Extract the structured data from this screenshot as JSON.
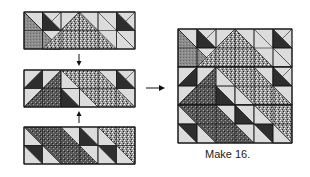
{
  "caption": "Make 16.",
  "colors": {
    "light": "#dcdcdc",
    "dark": "#2e2e2e",
    "medium": "#8a8a8a",
    "outline": "#1a1a1a",
    "arrow": "#111111"
  },
  "layout": {
    "strip_x": 24,
    "strip_cell": 18.5,
    "strips_y": [
      12,
      70,
      127
    ],
    "block_x": 178,
    "block_y": 29,
    "block_cell": 19
  },
  "strips": [
    {
      "name": "top-strip",
      "shapes": [
        {
          "type": "tri",
          "pts": [
            [
              0,
              0
            ],
            [
              1,
              0
            ],
            [
              1,
              1
            ]
          ],
          "fill": "light"
        },
        {
          "type": "tri",
          "pts": [
            [
              0,
              0
            ],
            [
              0,
              2
            ],
            [
              2,
              2
            ]
          ],
          "fill": "medium"
        },
        {
          "type": "tri",
          "pts": [
            [
              0,
              0
            ],
            [
              1,
              1
            ],
            [
              1,
              2
            ],
            [
              2,
              2
            ]
          ],
          "fill": "medium"
        },
        {
          "type": "tri",
          "pts": [
            [
              1,
              0
            ],
            [
              2,
              0
            ],
            [
              1,
              1
            ]
          ],
          "fill": "light"
        },
        {
          "type": "tri",
          "pts": [
            [
              1,
              0
            ],
            [
              2,
              1
            ],
            [
              1,
              1
            ]
          ],
          "fill": "dark"
        },
        {
          "type": "tri",
          "pts": [
            [
              2,
              0
            ],
            [
              3,
              0
            ],
            [
              2,
              1
            ]
          ],
          "fill": "light"
        },
        {
          "type": "tri",
          "pts": [
            [
              3,
              0
            ],
            [
              3,
              1
            ],
            [
              2,
              1
            ]
          ],
          "fill": "dark"
        },
        {
          "type": "tri",
          "pts": [
            [
              1,
              1
            ],
            [
              2,
              1
            ],
            [
              2,
              2
            ]
          ],
          "fill": "light"
        },
        {
          "type": "tri",
          "pts": [
            [
              2,
              1
            ],
            [
              3,
              1
            ],
            [
              2,
              2
            ]
          ],
          "fill": "light"
        },
        {
          "type": "tri",
          "pts": [
            [
              3,
              0
            ],
            [
              5,
              2
            ],
            [
              1,
              2
            ]
          ],
          "fill": "speckle"
        },
        {
          "type": "tri",
          "pts": [
            [
              3,
              0
            ],
            [
              4,
              0
            ],
            [
              4,
              1
            ]
          ],
          "fill": "light"
        },
        {
          "type": "tri",
          "pts": [
            [
              4,
              0
            ],
            [
              5,
              0
            ],
            [
              5,
              1
            ]
          ],
          "fill": "light"
        },
        {
          "type": "tri",
          "pts": [
            [
              5,
              0
            ],
            [
              6,
              0
            ],
            [
              5,
              1
            ]
          ],
          "fill": "light"
        },
        {
          "type": "tri",
          "pts": [
            [
              5,
              0
            ],
            [
              6,
              1
            ],
            [
              5,
              1
            ]
          ],
          "fill": "dark"
        },
        {
          "type": "tri",
          "pts": [
            [
              5,
              1
            ],
            [
              6,
              1
            ],
            [
              6,
              2
            ]
          ],
          "fill": "light"
        },
        {
          "type": "tri",
          "pts": [
            [
              5,
              1
            ],
            [
              6,
              2
            ],
            [
              5,
              2
            ]
          ],
          "fill": "light"
        }
      ]
    },
    {
      "name": "middle-strip",
      "shapes": [
        {
          "type": "tri",
          "pts": [
            [
              0,
              0
            ],
            [
              1,
              0
            ],
            [
              0,
              1
            ]
          ],
          "fill": "light"
        },
        {
          "type": "tri",
          "pts": [
            [
              1,
              0
            ],
            [
              1,
              1
            ],
            [
              0,
              1
            ]
          ],
          "fill": "dark"
        },
        {
          "type": "tri",
          "pts": [
            [
              0,
              1
            ],
            [
              1,
              1
            ],
            [
              0,
              2
            ]
          ],
          "fill": "light"
        },
        {
          "type": "tri",
          "pts": [
            [
              2,
              0
            ],
            [
              0,
              2
            ],
            [
              2,
              2
            ]
          ],
          "fill": "darkspeckle"
        },
        {
          "type": "tri",
          "pts": [
            [
              1,
              0
            ],
            [
              2,
              0
            ],
            [
              1,
              1
            ]
          ],
          "fill": "light"
        },
        {
          "type": "tri",
          "pts": [
            [
              2,
              0
            ],
            [
              4,
              0
            ],
            [
              6,
              2
            ],
            [
              4,
              2
            ]
          ],
          "fill": "speckle"
        },
        {
          "type": "tri",
          "pts": [
            [
              2,
              1
            ],
            [
              3,
              1
            ],
            [
              3,
              2
            ]
          ],
          "fill": "light"
        },
        {
          "type": "tri",
          "pts": [
            [
              2,
              1
            ],
            [
              3,
              2
            ],
            [
              2,
              2
            ]
          ],
          "fill": "dark"
        },
        {
          "type": "tri",
          "pts": [
            [
              3,
              1
            ],
            [
              4,
              2
            ],
            [
              3,
              2
            ]
          ],
          "fill": "light"
        },
        {
          "type": "tri",
          "pts": [
            [
              4,
              0
            ],
            [
              5,
              0
            ],
            [
              5,
              1
            ]
          ],
          "fill": "light"
        },
        {
          "type": "tri",
          "pts": [
            [
              5,
              0
            ],
            [
              6,
              0
            ],
            [
              5,
              1
            ]
          ],
          "fill": "light"
        },
        {
          "type": "tri",
          "pts": [
            [
              5,
              0
            ],
            [
              6,
              1
            ],
            [
              5,
              1
            ]
          ],
          "fill": "dark"
        },
        {
          "type": "tri",
          "pts": [
            [
              5,
              1
            ],
            [
              6,
              1
            ],
            [
              6,
              2
            ]
          ],
          "fill": "light"
        }
      ]
    },
    {
      "name": "bottom-strip",
      "shapes": [
        {
          "type": "tri",
          "pts": [
            [
              0,
              0
            ],
            [
              2,
              0
            ],
            [
              4,
              2
            ],
            [
              2,
              2
            ]
          ],
          "fill": "darkspeckle"
        },
        {
          "type": "tri",
          "pts": [
            [
              0,
              0
            ],
            [
              1,
              1
            ],
            [
              0,
              1
            ]
          ],
          "fill": "light"
        },
        {
          "type": "tri",
          "pts": [
            [
              0,
              1
            ],
            [
              1,
              1
            ],
            [
              1,
              2
            ]
          ],
          "fill": "dark"
        },
        {
          "type": "tri",
          "pts": [
            [
              0,
              1
            ],
            [
              1,
              2
            ],
            [
              0,
              2
            ]
          ],
          "fill": "light"
        },
        {
          "type": "tri",
          "pts": [
            [
              1,
              1
            ],
            [
              2,
              2
            ],
            [
              1,
              2
            ]
          ],
          "fill": "light"
        },
        {
          "type": "tri",
          "pts": [
            [
              2,
              0
            ],
            [
              3,
              0
            ],
            [
              3,
              1
            ]
          ],
          "fill": "light"
        },
        {
          "type": "tri",
          "pts": [
            [
              3,
              0
            ],
            [
              4,
              0
            ],
            [
              4,
              1
            ]
          ],
          "fill": "light"
        },
        {
          "type": "tri",
          "pts": [
            [
              3,
              0
            ],
            [
              4,
              1
            ],
            [
              3,
              1
            ]
          ],
          "fill": "dark"
        },
        {
          "type": "tri",
          "pts": [
            [
              3,
              1
            ],
            [
              4,
              1
            ],
            [
              4,
              2
            ]
          ],
          "fill": "light"
        },
        {
          "type": "tri",
          "pts": [
            [
              4,
              0
            ],
            [
              6,
              0
            ],
            [
              6,
              2
            ]
          ],
          "fill": "speckle"
        },
        {
          "type": "tri",
          "pts": [
            [
              4,
              0
            ],
            [
              6,
              2
            ],
            [
              4,
              2
            ]
          ],
          "fill": "light"
        },
        {
          "type": "tri",
          "pts": [
            [
              4,
              1
            ],
            [
              5,
              1
            ],
            [
              5,
              2
            ]
          ],
          "fill": "dark"
        },
        {
          "type": "tri",
          "pts": [
            [
              5,
              1
            ],
            [
              6,
              2
            ],
            [
              5,
              2
            ]
          ],
          "fill": "light"
        }
      ]
    }
  ],
  "arrows": [
    {
      "name": "down-arrow-icon",
      "x": 79,
      "y1": 54,
      "y2": 66,
      "dir": "down"
    },
    {
      "name": "up-arrow-icon",
      "x": 79,
      "y1": 123,
      "y2": 111,
      "dir": "up"
    },
    {
      "name": "right-arrow-icon",
      "x1": 146,
      "x2": 165,
      "y": 88,
      "dir": "right"
    }
  ]
}
